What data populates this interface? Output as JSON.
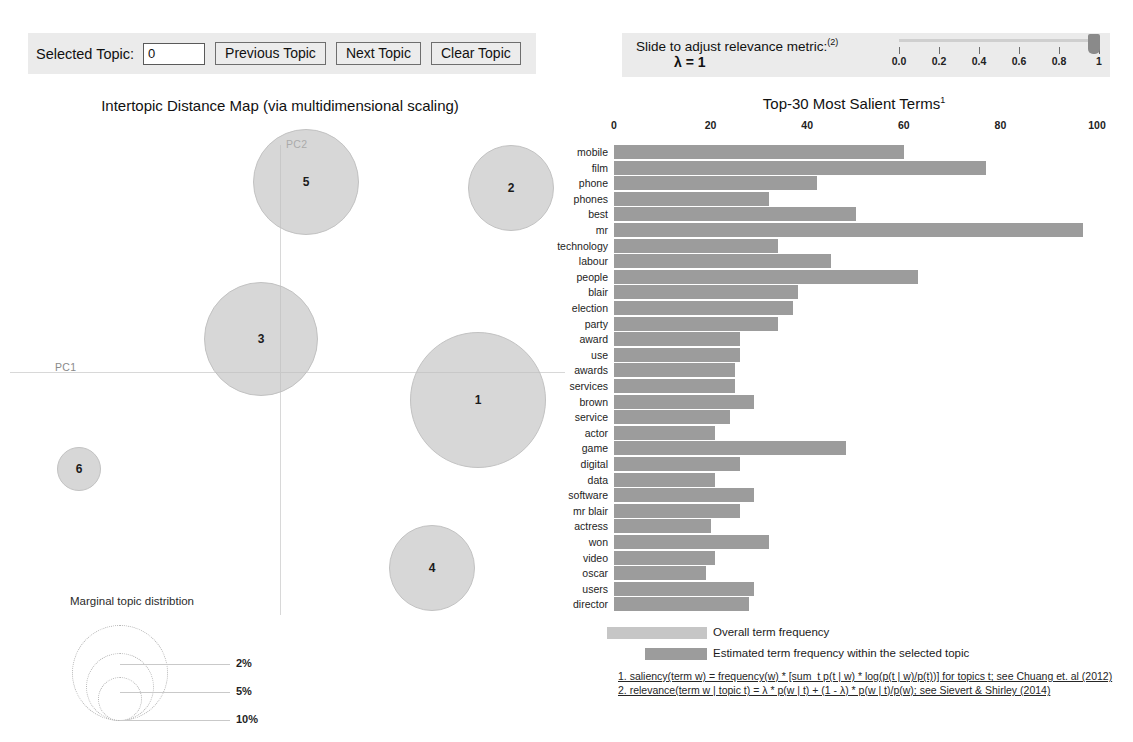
{
  "topic_controls": {
    "label": "Selected Topic:",
    "selected_topic_value": "0",
    "previous_label": "Previous Topic",
    "next_label": "Next Topic",
    "clear_label": "Clear Topic"
  },
  "slider": {
    "caption": "Slide to adjust relevance metric:",
    "caption_superscript": "(2)",
    "lambda_text": "λ = 1",
    "tick_labels": [
      "0.0",
      "0.2",
      "0.4",
      "0.6",
      "0.8",
      "1"
    ],
    "value": 1
  },
  "map": {
    "title": "Intertopic Distance Map (via multidimensional scaling)",
    "axis_x_label": "PC1",
    "axis_y_label": "PC2",
    "bubbles": [
      {
        "id": "1",
        "cx": 478,
        "cy": 400,
        "r": 68
      },
      {
        "id": "2",
        "cx": 511,
        "cy": 188,
        "r": 43
      },
      {
        "id": "3",
        "cx": 261,
        "cy": 339,
        "r": 57
      },
      {
        "id": "4",
        "cx": 432,
        "cy": 568,
        "r": 43
      },
      {
        "id": "5",
        "cx": 306,
        "cy": 182,
        "r": 53
      },
      {
        "id": "6",
        "cx": 79,
        "cy": 469,
        "r": 22
      }
    ],
    "marginal_legend": {
      "title": "Marginal topic distribtion",
      "entries": [
        {
          "label": "2%",
          "r": 22
        },
        {
          "label": "5%",
          "r": 34
        },
        {
          "label": "10%",
          "r": 48
        }
      ]
    }
  },
  "chart_data": {
    "type": "bar",
    "orientation": "horizontal",
    "title": "Top-30 Most Salient Terms",
    "title_superscript": "1",
    "xlabel": "",
    "ylabel": "",
    "xlim": [
      0,
      100
    ],
    "xticks": [
      0,
      20,
      40,
      60,
      80,
      100
    ],
    "grid": false,
    "legend_position": "bottom",
    "categories": [
      "mobile",
      "film",
      "phone",
      "phones",
      "best",
      "mr",
      "technology",
      "labour",
      "people",
      "blair",
      "election",
      "party",
      "award",
      "use",
      "awards",
      "services",
      "brown",
      "service",
      "actor",
      "game",
      "digital",
      "data",
      "software",
      "mr blair",
      "actress",
      "won",
      "video",
      "oscar",
      "users",
      "director"
    ],
    "series": [
      {
        "name": "Overall term frequency",
        "color": "#c6c6c6",
        "values": [
          60,
          77,
          42,
          32,
          50,
          97,
          34,
          45,
          63,
          38,
          37,
          34,
          26,
          26,
          25,
          25,
          29,
          24,
          21,
          48,
          26,
          21,
          29,
          26,
          20,
          32,
          21,
          19,
          29,
          28
        ]
      }
    ],
    "legend": [
      {
        "label": "Overall term frequency",
        "color": "#c6c6c6"
      },
      {
        "label": "Estimated term frequency within the selected topic",
        "color": "#9c9c9c"
      }
    ]
  },
  "footnotes": {
    "one": "1. saliency(term w) = frequency(w) * [sum_t p(t | w) * log(p(t | w)/p(t))] for topics t; see Chuang et. al (2012)",
    "two": "2. relevance(term w | topic t) = λ * p(w | t) + (1 - λ) * p(w | t)/p(w); see Sievert & Shirley (2014)"
  }
}
